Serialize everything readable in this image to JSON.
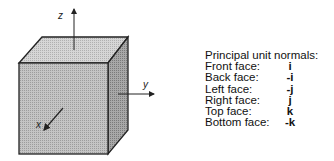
{
  "diagram": {
    "axes": {
      "z": "z",
      "y": "y",
      "x": "x"
    },
    "colors": {
      "face_front": "#b9b9b9",
      "face_top": "#cfcfcf",
      "face_right": "#9a9a9a",
      "edge": "#222222"
    }
  },
  "legend": {
    "title": "Principal unit normals:",
    "rows": [
      {
        "label": "Front face:",
        "value": "i"
      },
      {
        "label": "Back face:",
        "value": "-i"
      },
      {
        "label": "Left face:",
        "value": "-j"
      },
      {
        "label": "Right face:",
        "value": "j"
      },
      {
        "label": "Top face:",
        "value": "k"
      },
      {
        "label": "Bottom face:",
        "value": "-k"
      }
    ]
  }
}
